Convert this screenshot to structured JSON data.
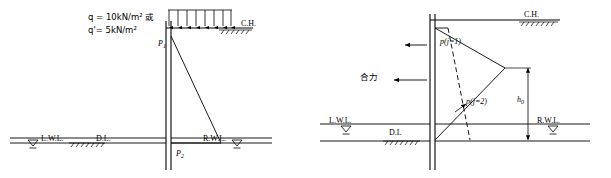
{
  "figure": {
    "title": "",
    "left_diagram": {
      "name": "sheet-pile-earth-pressure-left",
      "labels": {
        "surcharge_line1": "q = 10kN/m² 或",
        "surcharge_line2": "q'= 5kN/m²",
        "p1": "P",
        "p1_sub": "1",
        "p2": "P",
        "p2_sub": "2",
        "ch": "C.H.",
        "lwl": "L.W.L.",
        "dl": "D.L.",
        "rwl": "R.W.L."
      }
    },
    "right_diagram": {
      "name": "sheet-pile-earth-pressure-right",
      "labels": {
        "ch": "C.H.",
        "pressure_j1": "p(j=1)",
        "pressure_j2": "p(j=2)",
        "resultant": "合力",
        "height": "h",
        "height_sub": "0",
        "lwl": "L.W.L.",
        "dl": "D.L",
        "rwl": "R.W.L."
      }
    },
    "colors": {
      "stroke": "#000000",
      "background": "#ffffff"
    }
  }
}
